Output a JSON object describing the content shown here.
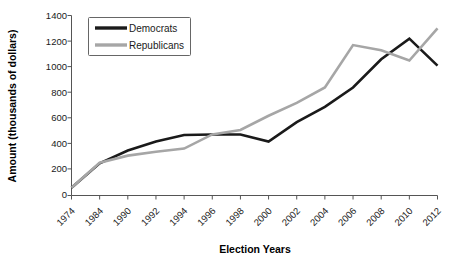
{
  "chart_data": {
    "type": "line",
    "title": "",
    "xlabel": "Election Years",
    "ylabel": "Amount (thousands of dollars)",
    "categories": [
      "1974",
      "1984",
      "1990",
      "1992",
      "1994",
      "1996",
      "1998",
      "2000",
      "2002",
      "2004",
      "2006",
      "2008",
      "2010",
      "2012"
    ],
    "ylim": [
      0,
      1400
    ],
    "yticks": [
      0,
      200,
      400,
      600,
      800,
      1000,
      1200,
      1400
    ],
    "grid": false,
    "legend_position": "top-left",
    "series": [
      {
        "name": "Democrats",
        "color": "#1a1a1a",
        "values": [
          60,
          250,
          350,
          420,
          470,
          475,
          475,
          420,
          570,
          690,
          840,
          1060,
          1220,
          1010
        ]
      },
      {
        "name": "Republicans",
        "color": "#a6a6a6",
        "values": [
          60,
          255,
          310,
          340,
          365,
          475,
          510,
          620,
          720,
          840,
          1170,
          1130,
          1050,
          1300
        ]
      }
    ]
  },
  "axes": {
    "y_title": "Amount (thousands of dollars)",
    "x_title": "Election Years",
    "y_tick_labels": [
      "1400",
      "1200",
      "1000",
      "800",
      "600",
      "400",
      "200",
      "0"
    ],
    "x_tick_labels": [
      "1974",
      "1984",
      "1990",
      "1992",
      "1994",
      "1996",
      "1998",
      "2000",
      "2002",
      "2004",
      "2006",
      "2008",
      "2010",
      "2012"
    ]
  },
  "legend": {
    "items": [
      {
        "label": "Democrats",
        "color": "#1a1a1a"
      },
      {
        "label": "Republicans",
        "color": "#a6a6a6"
      }
    ]
  }
}
